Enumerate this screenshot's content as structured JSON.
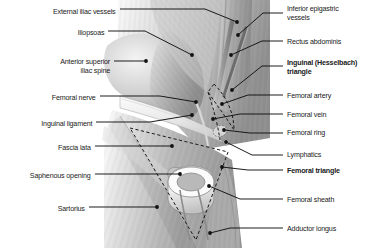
{
  "figure": {
    "style": "grayscale anatomical illustration",
    "background_color": "#ffffff",
    "leader_line_color": "#111111",
    "illustration_bounds": {
      "x": 97,
      "y": 0,
      "width": 173,
      "height": 248
    }
  },
  "labels_left": [
    {
      "id": "external-iliac-vessels",
      "text": "External iliac vessels",
      "bold": false,
      "text_x": 116,
      "text_y": 12,
      "leader": [
        [
          120,
          9
        ],
        [
          205,
          9
        ],
        [
          237,
          22
        ]
      ],
      "dot": [
        237,
        22
      ]
    },
    {
      "id": "iliopsoas",
      "text": "Iliopsoas",
      "bold": false,
      "text_y": 33,
      "text_x": 104,
      "leader": [
        [
          108,
          31
        ],
        [
          145,
          31
        ],
        [
          192,
          55
        ]
      ],
      "dot": [
        192,
        55
      ]
    },
    {
      "id": "anterior-superior-iliac-spine",
      "text": "Anterior superior\niliac spine",
      "bold": false,
      "text_x": 110,
      "text_y": 62,
      "leader": [
        [
          114,
          61
        ],
        [
          146,
          61
        ]
      ],
      "dot": [
        146,
        61
      ]
    },
    {
      "id": "femoral-nerve",
      "text": "Femoral nerve",
      "bold": false,
      "text_x": 96,
      "text_y": 98,
      "leader": [
        [
          100,
          96
        ],
        [
          160,
          96
        ],
        [
          196,
          102
        ]
      ],
      "dot": [
        196,
        102
      ]
    },
    {
      "id": "inguinal-ligament",
      "text": "Inguinal ligament",
      "bold": false,
      "text_x": 92,
      "text_y": 124,
      "leader": [
        [
          96,
          122
        ],
        [
          150,
          122
        ],
        [
          192,
          115
        ]
      ],
      "dot": [
        192,
        115
      ]
    },
    {
      "id": "fascia-lata",
      "text": "Fascia lata",
      "bold": false,
      "text_x": 91,
      "text_y": 148,
      "leader": [
        [
          95,
          146
        ],
        [
          172,
          146
        ]
      ],
      "dot": [
        172,
        146
      ]
    },
    {
      "id": "saphenous-opening",
      "text": "Saphenous opening",
      "bold": false,
      "text_x": 91,
      "text_y": 176,
      "leader": [
        [
          95,
          174
        ],
        [
          180,
          174
        ]
      ],
      "dot": [
        180,
        174
      ]
    },
    {
      "id": "sartorius",
      "text": "Sartorius",
      "bold": false,
      "text_x": 85,
      "text_y": 209,
      "leader": [
        [
          89,
          207
        ],
        [
          157,
          207
        ]
      ],
      "dot": [
        157,
        207
      ]
    }
  ],
  "labels_right": [
    {
      "id": "inferior-epigastric-vessels",
      "text": "Inferior epigastric\nvessels",
      "bold": false,
      "text_x": 287,
      "text_y": 9,
      "leader": [
        [
          283,
          13
        ],
        [
          263,
          13
        ],
        [
          238,
          35
        ]
      ],
      "dot": [
        238,
        35
      ]
    },
    {
      "id": "rectus-abdominis",
      "text": "Rectus abdominis",
      "bold": false,
      "text_x": 287,
      "text_y": 42,
      "leader": [
        [
          283,
          41
        ],
        [
          262,
          41
        ],
        [
          231,
          55
        ]
      ],
      "dot": [
        231,
        55
      ]
    },
    {
      "id": "inguinal-hesselbach-triangle",
      "text": "Inguinal (Hesselbach)\ntriangle",
      "bold": true,
      "text_x": 287,
      "text_y": 63,
      "leader": [
        [
          283,
          66
        ],
        [
          262,
          66
        ],
        [
          232,
          90
        ]
      ],
      "dot": [
        232,
        90
      ]
    },
    {
      "id": "femoral-artery",
      "text": "Femoral artery",
      "bold": false,
      "text_x": 287,
      "text_y": 96,
      "leader": [
        [
          283,
          95
        ],
        [
          248,
          95
        ],
        [
          222,
          104
        ]
      ],
      "dot": [
        222,
        104
      ]
    },
    {
      "id": "femoral-vein",
      "text": "Femoral vein",
      "bold": false,
      "text_x": 287,
      "text_y": 115,
      "leader": [
        [
          283,
          114
        ],
        [
          240,
          114
        ],
        [
          213,
          119
        ]
      ],
      "dot": [
        213,
        119
      ]
    },
    {
      "id": "femoral-ring",
      "text": "Femoral ring",
      "bold": false,
      "text_x": 287,
      "text_y": 133,
      "leader": [
        [
          283,
          133
        ],
        [
          250,
          133
        ],
        [
          224,
          130
        ]
      ],
      "dot": [
        224,
        130
      ]
    },
    {
      "id": "lymphatics",
      "text": "Lymphatics",
      "bold": false,
      "text_x": 287,
      "text_y": 155,
      "leader": [
        [
          283,
          155
        ],
        [
          252,
          155
        ],
        [
          226,
          142
        ]
      ],
      "dot": [
        226,
        142
      ]
    },
    {
      "id": "femoral-triangle",
      "text": "Femoral triangle",
      "bold": true,
      "text_x": 287,
      "text_y": 171,
      "leader": [
        [
          283,
          170
        ],
        [
          248,
          170
        ],
        [
          222,
          167
        ]
      ],
      "dot": [
        222,
        167
      ]
    },
    {
      "id": "femoral-sheath",
      "text": "Femoral sheath",
      "bold": false,
      "text_x": 287,
      "text_y": 200,
      "leader": [
        [
          283,
          199
        ],
        [
          240,
          199
        ],
        [
          209,
          186
        ]
      ],
      "dot": [
        209,
        186
      ]
    },
    {
      "id": "adductor-longus",
      "text": "Adductor longus",
      "bold": false,
      "text_x": 287,
      "text_y": 229,
      "leader": [
        [
          283,
          228
        ],
        [
          230,
          228
        ],
        [
          210,
          233
        ]
      ],
      "dot": [
        210,
        233
      ]
    }
  ]
}
